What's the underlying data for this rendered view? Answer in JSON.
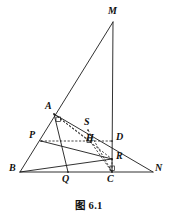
{
  "figure": {
    "caption": "图 6.1",
    "caption_position": {
      "x": 0,
      "y": 197
    },
    "stroke_color": "#1a1a1a",
    "background_color": "#ffffff",
    "width": 178,
    "height": 216,
    "points": [
      {
        "id": "M",
        "label": "M",
        "x": 113,
        "y": 22,
        "label_x": 108,
        "label_y": 6
      },
      {
        "id": "A",
        "label": "A",
        "x": 54,
        "y": 114,
        "label_x": 45,
        "label_y": 101
      },
      {
        "id": "S",
        "label": "S",
        "x": 88,
        "y": 130,
        "label_x": 84,
        "label_y": 117
      },
      {
        "id": "H",
        "label": "H",
        "x": 90,
        "y": 141,
        "label_x": 86,
        "label_y": 133
      },
      {
        "id": "D",
        "label": "D",
        "x": 112,
        "y": 141,
        "label_x": 116,
        "label_y": 132
      },
      {
        "id": "P",
        "label": "P",
        "x": 41,
        "y": 141,
        "label_x": 29,
        "label_y": 130
      },
      {
        "id": "R",
        "label": "R",
        "x": 112,
        "y": 159,
        "label_x": 116,
        "label_y": 151
      },
      {
        "id": "B",
        "label": "B",
        "x": 20,
        "y": 172,
        "label_x": 9,
        "label_y": 163
      },
      {
        "id": "Q",
        "label": "Q",
        "x": 68,
        "y": 172,
        "label_x": 62,
        "label_y": 174
      },
      {
        "id": "C",
        "label": "C",
        "x": 112,
        "y": 172,
        "label_x": 107,
        "label_y": 174
      },
      {
        "id": "N",
        "label": "N",
        "x": 153,
        "y": 172,
        "label_x": 155,
        "label_y": 163
      }
    ],
    "solid_segments": [
      {
        "name": "segment-BM",
        "from": "B",
        "to": "M"
      },
      {
        "name": "segment-MC",
        "from": "M",
        "to": "C"
      },
      {
        "name": "segment-BN",
        "from": "B",
        "to": "N"
      },
      {
        "name": "segment-AN",
        "from": "A",
        "to": "N"
      },
      {
        "name": "segment-AQ",
        "from": "A",
        "to": "Q"
      },
      {
        "name": "segment-PR",
        "from": "P",
        "to": "R"
      },
      {
        "name": "segment-BR",
        "from": "B",
        "to": "R"
      }
    ],
    "dashed_segments": [
      {
        "name": "segment-PD-dashed",
        "from": "P",
        "to": "D"
      },
      {
        "name": "segment-AH-dashed",
        "from": "A",
        "to": "H"
      },
      {
        "name": "segment-HC-dashed",
        "from": "H",
        "to": "C"
      },
      {
        "name": "segment-AR-dashed",
        "from": "A",
        "to": "R"
      },
      {
        "name": "segment-CR-dashed",
        "from": "C",
        "to": "R"
      },
      {
        "name": "segment-SC-dashed",
        "from": "S",
        "to": "C"
      }
    ],
    "right_angle_marks": [
      {
        "name": "right-angle-at-A",
        "x": 56,
        "y": 117
      },
      {
        "name": "right-angle-at-H",
        "x": 87,
        "y": 138
      },
      {
        "name": "right-angle-at-C",
        "x": 110,
        "y": 166
      }
    ]
  }
}
